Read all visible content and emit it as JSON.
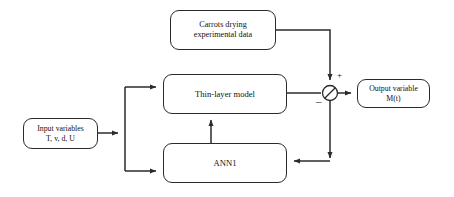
{
  "diagram": {
    "type": "block-diagram",
    "background_color": "#ffffff",
    "line_color": "#2b2b2b",
    "text_color": "#111111",
    "nodes": [
      {
        "id": "carrots",
        "label": "Carrots drying\nexperimental data",
        "shape": "rounded-rectangle",
        "x": 170,
        "y": 10,
        "w": 106,
        "h": 40
      },
      {
        "id": "thinlayer",
        "label": "Thin-layer model",
        "shape": "rounded-rectangle",
        "x": 163,
        "y": 74,
        "w": 124,
        "h": 40
      },
      {
        "id": "ann1",
        "label": "ANN1",
        "shape": "rounded-rectangle",
        "x": 163,
        "y": 143,
        "w": 124,
        "h": 40
      },
      {
        "id": "input",
        "label": "Input variables\nT, v, d, U",
        "shape": "rounded-rectangle",
        "x": 23,
        "y": 118,
        "w": 75,
        "h": 31
      },
      {
        "id": "output",
        "label": "Output variable\nM(t)",
        "shape": "rounded-rectangle",
        "x": 357,
        "y": 79,
        "w": 73,
        "h": 29
      }
    ],
    "summing_junction": {
      "id": "sum-node",
      "shape": "circle-with-diagonal",
      "cx": 330,
      "cy": 93,
      "r": 7.5,
      "positive_sign": "+",
      "negative_sign": "–"
    },
    "edges": [
      {
        "id": "input-to-fork",
        "from": "input",
        "to": "fork",
        "arrow": "right"
      },
      {
        "id": "fork-to-thinlayer",
        "from": "fork",
        "to": "thinlayer",
        "arrow": "right"
      },
      {
        "id": "fork-to-ann1",
        "from": "fork",
        "to": "ann1",
        "arrow": "right"
      },
      {
        "id": "ann1-to-thinlayer",
        "from": "ann1",
        "to": "thinlayer",
        "arrow": "up"
      },
      {
        "id": "carrots-to-sum",
        "from": "carrots",
        "to": "sum-node",
        "arrow": "down",
        "sign": "+"
      },
      {
        "id": "thinlayer-to-sum",
        "from": "thinlayer",
        "to": "sum-node",
        "arrow": "right",
        "sign": "–"
      },
      {
        "id": "sum-to-output",
        "from": "sum-node",
        "to": "output",
        "arrow": "right"
      },
      {
        "id": "sum-to-ann1-feedback",
        "from": "sum-node",
        "to": "ann1",
        "arrow": "down-left"
      }
    ]
  }
}
